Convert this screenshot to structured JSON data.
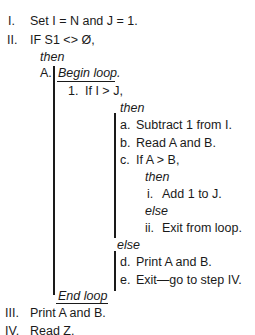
{
  "outline": {
    "step_I": {
      "marker": "I.",
      "text": "Set I = N and J = 1."
    },
    "step_II": {
      "marker": "II.",
      "text": "IF S1 <> Ø,"
    },
    "then_1": "then",
    "step_A": {
      "marker": "A.",
      "begin_loop": "Begin loop."
    },
    "step_1": {
      "marker": "1.",
      "text": "If I > J,"
    },
    "then_2": "then",
    "step_a": {
      "marker": "a.",
      "text": "Subtract 1 from I."
    },
    "step_b": {
      "marker": "b.",
      "text": "Read A and B."
    },
    "step_c": {
      "marker": "c.",
      "text": "If A > B,"
    },
    "then_3": "then",
    "step_i": {
      "marker": "i.",
      "text": "Add 1 to J."
    },
    "else_1": "else",
    "step_ii": {
      "marker": "ii.",
      "text": "Exit from loop."
    },
    "else_2": "else",
    "step_d": {
      "marker": "d.",
      "text": "Print A and B."
    },
    "step_e": {
      "marker": "e.",
      "text": "Exit—go to step IV."
    },
    "end_loop": "End loop",
    "step_III": {
      "marker": "III.",
      "text": "Print A and B."
    },
    "step_IV": {
      "marker": "IV.",
      "text": "Read Z."
    }
  }
}
